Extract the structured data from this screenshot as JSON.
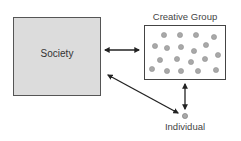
{
  "diagram": {
    "society": {
      "label": "Society",
      "fill": "#dcdcdc"
    },
    "creative_group": {
      "label": "Creative Group",
      "members": [
        {
          "x": 164,
          "y": 35
        },
        {
          "x": 180,
          "y": 35
        },
        {
          "x": 196,
          "y": 35
        },
        {
          "x": 214,
          "y": 37
        },
        {
          "x": 155,
          "y": 46
        },
        {
          "x": 167,
          "y": 48
        },
        {
          "x": 181,
          "y": 47
        },
        {
          "x": 194,
          "y": 51
        },
        {
          "x": 206,
          "y": 45
        },
        {
          "x": 160,
          "y": 60
        },
        {
          "x": 177,
          "y": 59
        },
        {
          "x": 191,
          "y": 62
        },
        {
          "x": 205,
          "y": 59
        },
        {
          "x": 218,
          "y": 55
        },
        {
          "x": 152,
          "y": 69
        },
        {
          "x": 167,
          "y": 71
        },
        {
          "x": 181,
          "y": 71
        },
        {
          "x": 198,
          "y": 71
        },
        {
          "x": 216,
          "y": 70
        }
      ],
      "member_color": "#a8a8a8"
    },
    "individual": {
      "label": "Individual",
      "x": 185,
      "y": 116,
      "color": "#a8a8a8"
    },
    "connections": [
      {
        "from": "society",
        "to": "creative_group",
        "type": "bidirectional"
      },
      {
        "from": "creative_group",
        "to": "individual",
        "type": "bidirectional"
      },
      {
        "from": "society",
        "to": "individual",
        "type": "bidirectional"
      }
    ]
  }
}
